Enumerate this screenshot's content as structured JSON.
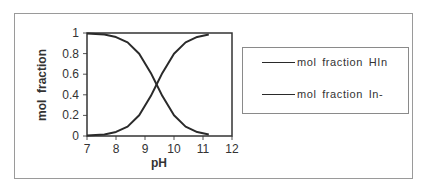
{
  "chart_data": {
    "type": "line",
    "title": "",
    "xlabel": "pH",
    "ylabel": "mol  fraction",
    "xlim": [
      7,
      12
    ],
    "ylim": [
      0,
      1
    ],
    "xticks": [
      7,
      8,
      9,
      10,
      11,
      12
    ],
    "yticks": [
      0,
      0.2,
      0.4,
      0.6,
      0.8,
      1
    ],
    "ytick_labels": [
      "0",
      "0.2",
      "0.4",
      "0.6",
      "0.8",
      "1"
    ],
    "xtick_labels": [
      "7",
      "8",
      "9",
      "10",
      "11",
      "12"
    ],
    "grid": false,
    "legend_position": "right",
    "x": [
      7.0,
      7.6,
      8.0,
      8.4,
      8.8,
      9.2,
      9.4,
      9.6,
      10.0,
      10.4,
      10.8,
      11.2
    ],
    "series": [
      {
        "name": "mol  fraction  HIn",
        "values": [
          0.996,
          0.984,
          0.96,
          0.909,
          0.799,
          0.613,
          0.5,
          0.387,
          0.201,
          0.091,
          0.038,
          0.016
        ]
      },
      {
        "name": "mol  fraction  In-",
        "values": [
          0.004,
          0.016,
          0.04,
          0.091,
          0.201,
          0.387,
          0.5,
          0.613,
          0.799,
          0.909,
          0.962,
          0.984
        ]
      }
    ]
  },
  "legend": {
    "items": [
      {
        "label": "mol  fraction  HIn"
      },
      {
        "label": "mol  fraction  In-"
      }
    ]
  },
  "colors": {
    "line": "#2a2a2a",
    "axis": "#333333",
    "border": "#9a9a9a"
  }
}
